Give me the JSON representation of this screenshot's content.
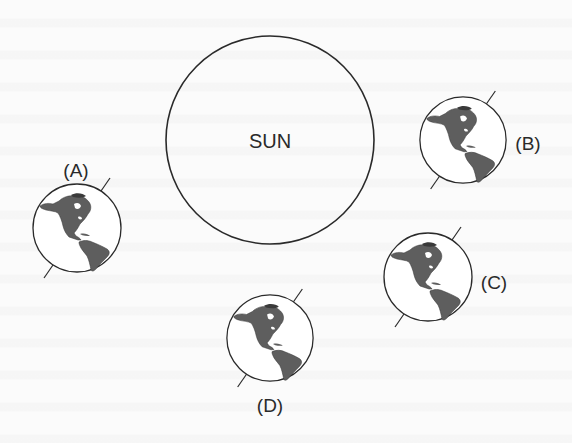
{
  "diagram": {
    "type": "sun-earth-orbit-positions",
    "colors": {
      "background": "#fbfbfb",
      "outline": "#2a2a2a",
      "land": "#5e5e5e",
      "ocean": "#ffffff"
    },
    "sun": {
      "label": "SUN",
      "cx": 270,
      "cy": 140,
      "r": 104
    },
    "earths": [
      {
        "id": "A",
        "label": "(A)",
        "cx": 77,
        "cy": 228,
        "r": 44,
        "label_x": 76,
        "label_y": 170
      },
      {
        "id": "B",
        "label": "(B)",
        "cx": 463,
        "cy": 140,
        "r": 43,
        "label_x": 528,
        "label_y": 143
      },
      {
        "id": "C",
        "label": "(C)",
        "cx": 428,
        "cy": 277,
        "r": 44,
        "label_x": 494,
        "label_y": 282
      },
      {
        "id": "D",
        "label": "(D)",
        "cx": 270,
        "cy": 338,
        "r": 43,
        "label_x": 270,
        "label_y": 405
      }
    ]
  }
}
